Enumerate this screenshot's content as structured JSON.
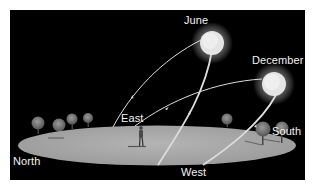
{
  "diagram": {
    "seasons": {
      "june": "June",
      "december": "December"
    },
    "directions": {
      "north": "North",
      "east": "East",
      "south": "South",
      "west": "West"
    },
    "colors": {
      "sky": "#000000",
      "ground": "#a9a9a9",
      "sun": "#e8e8e8",
      "path": "#dcdcdc",
      "label": "#f2f2f2"
    }
  }
}
